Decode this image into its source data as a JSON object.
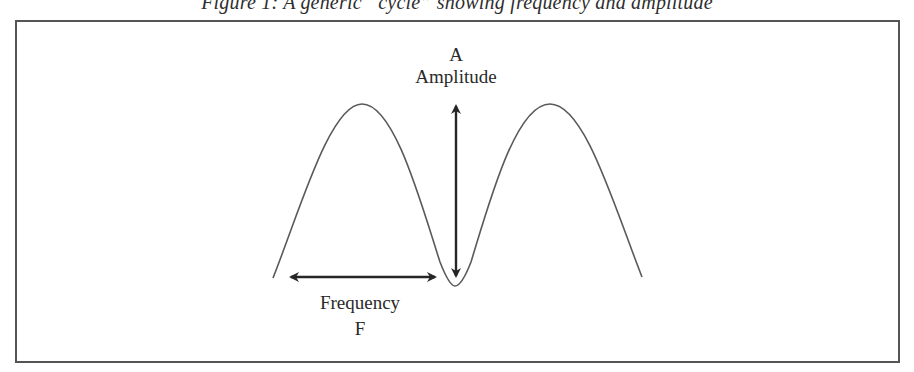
{
  "figure": {
    "caption": "Figure 1: A generic “cycle” showing frequency and amplitude"
  },
  "labels": {
    "amplitude_symbol": "A",
    "amplitude_label": "Amplitude",
    "frequency_label": "Frequency",
    "frequency_symbol": "F"
  },
  "colors": {
    "curve": "#5a5a5a",
    "arrow": "#262626",
    "frame": "#555555"
  },
  "diagram": {
    "curve_points": {
      "start": [
        273,
        278
      ],
      "peak_left": [
        362,
        104
      ],
      "trough": [
        455,
        286
      ],
      "peak_right": [
        550,
        104
      ],
      "end": [
        642,
        277
      ]
    },
    "amplitude_arrow": {
      "x": 456,
      "y_top": 103,
      "y_bottom": 279
    },
    "frequency_arrow": {
      "y": 277,
      "x_left": 288,
      "x_right": 438
    }
  }
}
